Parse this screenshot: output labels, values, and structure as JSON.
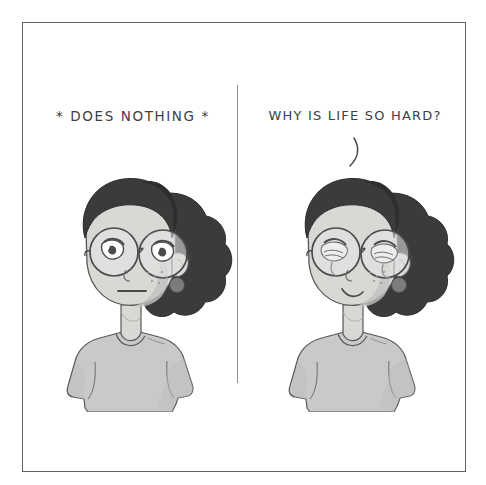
{
  "comic": {
    "title": "Two-panel comic: outward calm versus inner despair",
    "style": "hand-drawn pencil grayscale illustration",
    "background_color": "#ffffff",
    "frame": {
      "border_color": "#5f6061",
      "divider_color": "#8d8f90",
      "panel_count": 2
    },
    "palette": {
      "ink": "#4a4b4c",
      "caption_text": "#3e3f40",
      "hair_dark": "#3b3b3c",
      "hair_shadow": "#2e2e2f",
      "skin": "#d9d8d5",
      "skin_shade": "#c3c2bf",
      "shirt": "#c9c9c9",
      "shirt_shade": "#b4b4b4",
      "glasses_lens": "#e6e6e4",
      "earring": "#7d7c7a",
      "tear": "#ededec"
    },
    "panels": [
      {
        "id": "panel-left",
        "caption": "* DOES NOTHING *",
        "character": {
          "name": "girl-character",
          "expression": "neutral-blank-stare",
          "mouth": "flat-straight-line",
          "eyes": "half-lidded-looking-away",
          "tears": false,
          "accessories": [
            "round-glasses",
            "round-earring",
            "curly-bun-hair",
            "grey-t-shirt"
          ],
          "freckles": true
        },
        "speech_tail": false
      },
      {
        "id": "panel-right",
        "caption": "WHY IS LIFE SO HARD?",
        "character": {
          "name": "girl-character",
          "expression": "crying-while-smiling",
          "mouth": "small-wavy-smile",
          "eyes": "closed-crying-with-tears",
          "tears": true,
          "accessories": [
            "round-glasses",
            "round-earring",
            "curly-bun-hair",
            "grey-t-shirt"
          ],
          "freckles": true
        },
        "speech_tail": true
      }
    ]
  }
}
